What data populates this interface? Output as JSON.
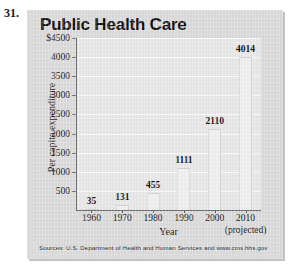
{
  "problem_number": "31.",
  "chart_data": {
    "type": "bar",
    "title": "Public Health Care",
    "xlabel": "Year",
    "ylabel": "Per capita expenditure",
    "categories": [
      "1960",
      "1970",
      "1980",
      "1990",
      "2000",
      "2010"
    ],
    "values": [
      35,
      131,
      455,
      1111,
      2110,
      4014
    ],
    "value_labels": [
      "35",
      "131",
      "455",
      "1111",
      "2110",
      "4014"
    ],
    "ylim": [
      0,
      4500
    ],
    "yticks": [
      500,
      1000,
      1500,
      2000,
      2500,
      3000,
      3500,
      4000,
      4500
    ],
    "ytick_labels": [
      "500",
      "1000",
      "1500",
      "2000",
      "2500",
      "3000",
      "3500",
      "4000",
      "$4500"
    ],
    "grid": "horizontal",
    "legend": "none",
    "annotations": [
      "(projected)"
    ],
    "source": "Sources: U.S. Department of Health and Human Services and www.cms.hhs.gov",
    "colors": {
      "plot_background": "#e9e9e9",
      "card_background": "#dcdcdc",
      "bar_fill": "#f1f1f1",
      "gridline": "#fbfbfb",
      "axis": "#5a5a5a",
      "text": "#0d0d0d"
    }
  },
  "projected_note": "(projected)"
}
